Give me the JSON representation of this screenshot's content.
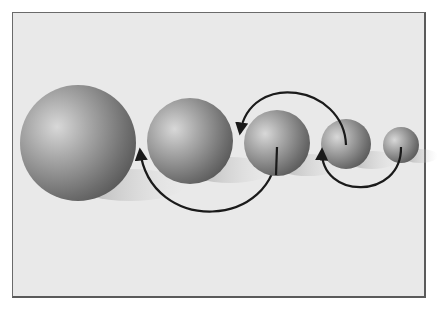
{
  "figure": {
    "background_color": "#e9e9e9",
    "frame_color": "#6a6a6a",
    "arrow_color": "#1a1a1a",
    "spheres": [
      {
        "id": "sphere-1",
        "cx": 78,
        "cy": 143,
        "r": 58
      },
      {
        "id": "sphere-2",
        "cx": 190,
        "cy": 141,
        "r": 43
      },
      {
        "id": "sphere-3",
        "cx": 277,
        "cy": 143,
        "r": 33
      },
      {
        "id": "sphere-4",
        "cx": 346,
        "cy": 144,
        "r": 25
      },
      {
        "id": "sphere-5",
        "cx": 401,
        "cy": 145,
        "r": 18
      }
    ],
    "arrows": [
      {
        "id": "arrow-sphere3-to-gap1",
        "from": "sphere-3 center",
        "to": "between sphere-1 and sphere-2",
        "direction": "down-around-left-up"
      },
      {
        "id": "arrow-sphere4-to-gap2",
        "from": "sphere-4 center",
        "to": "between sphere-2 and sphere-3",
        "direction": "up-around-left-down"
      },
      {
        "id": "arrow-sphere5-to-gap3",
        "from": "sphere-5 center",
        "to": "between sphere-3 and sphere-4",
        "direction": "down-around-left-up"
      }
    ]
  }
}
